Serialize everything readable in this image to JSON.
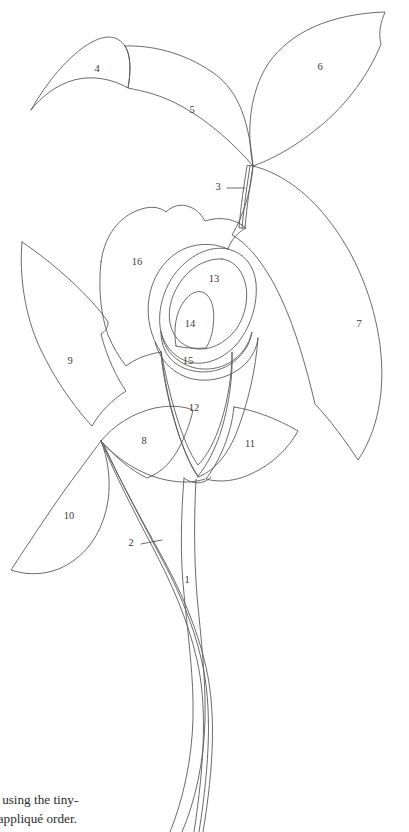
{
  "document": {
    "title": "Appliqué Pattern Diagram",
    "type": "line-art numbered appliqué placement pattern",
    "background_color": "#ffffff",
    "line_color": "#5a5a5a",
    "label_color": "#3a3a3a"
  },
  "pieces": [
    {
      "id": "1",
      "label": "1",
      "x": 187,
      "y": 581,
      "name": "stem-lower"
    },
    {
      "id": "2",
      "label": "2",
      "x": 131,
      "y": 544,
      "name": "stem-second",
      "leader": {
        "x1": 143,
        "y1": 544,
        "x2": 160,
        "y2": 541
      }
    },
    {
      "id": "3",
      "label": "3",
      "x": 218,
      "y": 188,
      "name": "stem-upper",
      "leader": {
        "x1": 227,
        "y1": 188,
        "x2": 245,
        "y2": 188
      }
    },
    {
      "id": "4",
      "label": "4",
      "x": 97,
      "y": 70,
      "name": "leaf-upper-left-small"
    },
    {
      "id": "5",
      "label": "5",
      "x": 192,
      "y": 111,
      "name": "leaf-upper-left-large"
    },
    {
      "id": "6",
      "label": "6",
      "x": 320,
      "y": 68,
      "name": "leaf-upper-right"
    },
    {
      "id": "7",
      "label": "7",
      "x": 359,
      "y": 325,
      "name": "leaf-right-large"
    },
    {
      "id": "8",
      "label": "8",
      "x": 144,
      "y": 442,
      "name": "leaf-center-small"
    },
    {
      "id": "9",
      "label": "9",
      "x": 70,
      "y": 362,
      "name": "leaf-left-pointed"
    },
    {
      "id": "10",
      "label": "10",
      "x": 69,
      "y": 517,
      "name": "leaf-lower-left"
    },
    {
      "id": "11",
      "label": "11",
      "x": 250,
      "y": 445,
      "name": "leaf-lower-right-fan"
    },
    {
      "id": "12",
      "label": "12",
      "x": 194,
      "y": 409,
      "name": "flower-body"
    },
    {
      "id": "13",
      "label": "13",
      "x": 214,
      "y": 280,
      "name": "flower-inner-ring"
    },
    {
      "id": "14",
      "label": "14",
      "x": 190,
      "y": 325,
      "name": "flower-spadix"
    },
    {
      "id": "15",
      "label": "15",
      "x": 188,
      "y": 362,
      "name": "flower-lower-lip"
    },
    {
      "id": "16",
      "label": "16",
      "x": 137,
      "y": 263,
      "name": "flower-outer-spathe"
    }
  ],
  "caption": {
    "line1": "ces using the tiny-",
    "line2": "ue appliqué order."
  }
}
